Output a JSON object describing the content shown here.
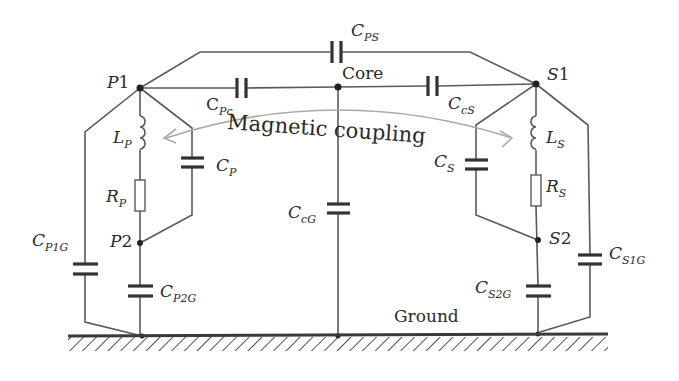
{
  "diagram": {
    "nodes": {
      "p1": {
        "label": "P",
        "num": "1"
      },
      "p2": {
        "label": "P",
        "num": "2"
      },
      "s1": {
        "label": "S",
        "num": "1"
      },
      "s2": {
        "label": "S",
        "num": "2"
      },
      "core": "Core",
      "ground": "Ground"
    },
    "components": {
      "cps": {
        "main": "C",
        "sub": "PS"
      },
      "cpc": {
        "main": "C",
        "sub": "Pc"
      },
      "ccs": {
        "main": "C",
        "sub": "cS"
      },
      "lp": {
        "main": "L",
        "sub": "P"
      },
      "cp": {
        "main": "C",
        "sub": "P"
      },
      "rp": {
        "main": "R",
        "sub": "P"
      },
      "ccg": {
        "main": "C",
        "sub": "cG"
      },
      "cs": {
        "main": "C",
        "sub": "S"
      },
      "ls": {
        "main": "L",
        "sub": "S"
      },
      "rs": {
        "main": "R",
        "sub": "S"
      },
      "cp1g": {
        "main": "C",
        "sub": "P1G"
      },
      "cp2g": {
        "main": "C",
        "sub": "P2G"
      },
      "cs2g": {
        "main": "C",
        "sub": "S2G"
      },
      "cs1g": {
        "main": "C",
        "sub": "S1G"
      }
    },
    "annotation": "Magnetic coupling",
    "colors": {
      "wire": "#555555",
      "capacitor": "#333333",
      "arrow": "#a8a8a8",
      "text": "#2a2a2a"
    }
  }
}
